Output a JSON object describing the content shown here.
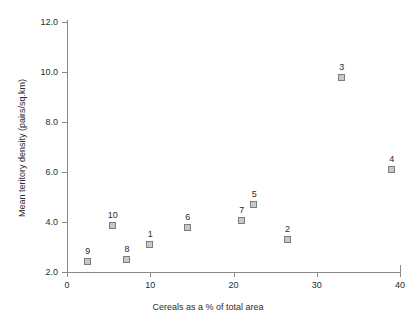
{
  "chart_data": {
    "type": "scatter",
    "title": "",
    "xlabel": "Cereals as a % of total area",
    "ylabel": "Mean teritory density (pairs/sq.km)",
    "xlim": [
      0,
      40
    ],
    "ylim": [
      2.0,
      12.0
    ],
    "grid": false,
    "legend": "none",
    "xticks": [
      "0",
      "10",
      "20",
      "30",
      "40"
    ],
    "xtick_values": [
      0,
      10,
      20,
      30,
      40
    ],
    "yticks": [
      "2.0",
      "4.0",
      "6.0",
      "8.0",
      "10.0",
      "12.0"
    ],
    "ytick_values": [
      2.0,
      4.0,
      6.0,
      8.0,
      10.0,
      12.0
    ],
    "marker": {
      "shape": "square",
      "fill_color": "#c8c8c8",
      "edge_color": "#7d7d7d"
    },
    "axis_color": "#8a8a8a",
    "text_color": "#2b2b2b",
    "background_color": "#ffffff",
    "points": [
      {
        "label": "9",
        "x": 2.5,
        "y": 2.4
      },
      {
        "label": "10",
        "x": 5.5,
        "y": 3.85
      },
      {
        "label": "8",
        "x": 7.2,
        "y": 2.5
      },
      {
        "label": "1",
        "x": 10.0,
        "y": 3.1
      },
      {
        "label": "6",
        "x": 14.5,
        "y": 3.75
      },
      {
        "label": "7",
        "x": 21.0,
        "y": 4.05
      },
      {
        "label": "5",
        "x": 22.5,
        "y": 4.7
      },
      {
        "label": "2",
        "x": 26.5,
        "y": 3.3
      },
      {
        "label": "3",
        "x": 33.0,
        "y": 9.75
      },
      {
        "label": "4",
        "x": 39.0,
        "y": 6.1
      }
    ]
  }
}
